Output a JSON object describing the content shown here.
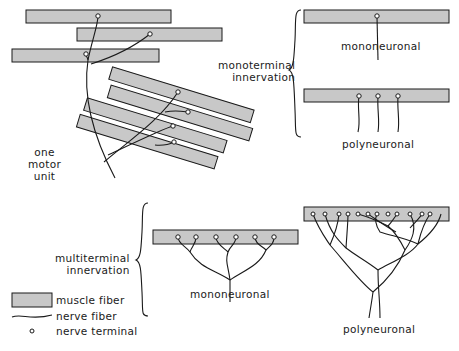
{
  "diagram": {
    "motor_unit_label": [
      "one",
      "motor",
      "unit"
    ],
    "monoterminal": {
      "label": [
        "monoterminal",
        "innervation"
      ],
      "mononeuronal": "mononeuronal",
      "polyneuronal": "polyneuronal"
    },
    "multiterminal": {
      "label": [
        "multiterminal",
        "innervation"
      ],
      "mononeuronal": "mononeuronal",
      "polyneuronal": "polyneuronal"
    },
    "legend": [
      {
        "symbol": "muscle-fiber",
        "label": "muscle fiber"
      },
      {
        "symbol": "nerve-fiber",
        "label": "nerve fiber"
      },
      {
        "symbol": "nerve-terminal",
        "label": "nerve terminal"
      }
    ],
    "colors": {
      "fiber_fill": "#c8c8c8",
      "stroke": "#1a1a1a"
    }
  }
}
